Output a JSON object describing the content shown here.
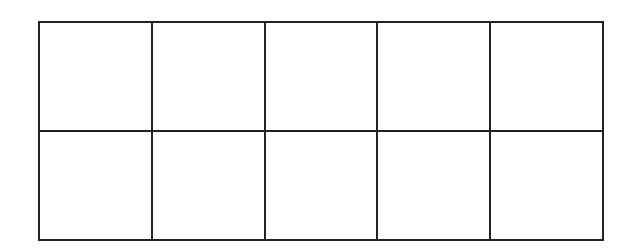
{
  "diagram": {
    "type": "ten-frame grid",
    "rows": 2,
    "columns": 5,
    "line_color": "#222222",
    "background": "#ffffff",
    "cells": [
      {
        "row": 1,
        "col": 1,
        "filled": false
      },
      {
        "row": 1,
        "col": 2,
        "filled": false
      },
      {
        "row": 1,
        "col": 3,
        "filled": false
      },
      {
        "row": 1,
        "col": 4,
        "filled": false
      },
      {
        "row": 1,
        "col": 5,
        "filled": false
      },
      {
        "row": 2,
        "col": 1,
        "filled": false
      },
      {
        "row": 2,
        "col": 2,
        "filled": false
      },
      {
        "row": 2,
        "col": 3,
        "filled": false
      },
      {
        "row": 2,
        "col": 4,
        "filled": false
      },
      {
        "row": 2,
        "col": 5,
        "filled": false
      }
    ]
  }
}
